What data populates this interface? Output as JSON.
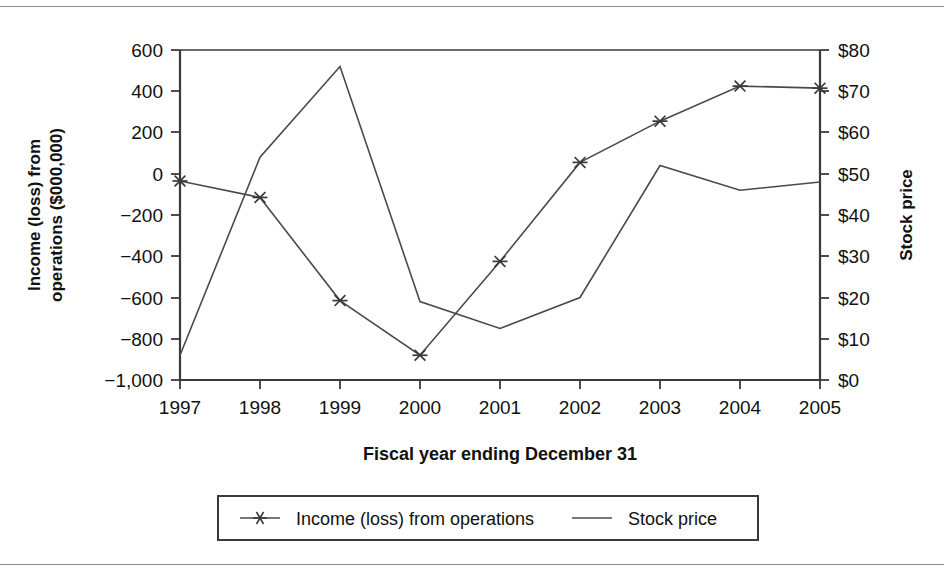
{
  "chart_data": {
    "type": "line",
    "title": "",
    "subtitle": "",
    "xlabel": "Fiscal year ending December 31",
    "categories": [
      "1997",
      "1998",
      "1999",
      "2000",
      "2001",
      "2002",
      "2003",
      "2004",
      "2005"
    ],
    "grid": false,
    "legend_position": "bottom",
    "axes": {
      "left": {
        "label": "Income (loss) from operations ($000,000)",
        "ticks": [
          "600",
          "400",
          "200",
          "0",
          "−200",
          "−400",
          "−600",
          "−800",
          "−1,000"
        ],
        "tick_values": [
          600,
          400,
          200,
          0,
          -200,
          -400,
          -600,
          -800,
          -1000
        ],
        "ylim": [
          -1000,
          600
        ]
      },
      "right": {
        "label": "Stock price",
        "ticks": [
          "$80",
          "$70",
          "$60",
          "$50",
          "$40",
          "$30",
          "$20",
          "$10",
          "$0"
        ],
        "tick_values": [
          80,
          70,
          60,
          50,
          40,
          30,
          20,
          10,
          0
        ],
        "ylim": [
          0,
          80
        ]
      }
    },
    "series": [
      {
        "name": "Income (loss) from operations",
        "axis": "left",
        "marker": "asterisk",
        "color": "#4a4a4a",
        "values": [
          -35,
          -115,
          -615,
          -880,
          -425,
          55,
          255,
          425,
          415
        ]
      },
      {
        "name": "Stock price",
        "axis": "right",
        "marker": "none",
        "color": "#4a4a4a",
        "values": [
          6,
          54,
          76,
          19,
          12.5,
          20,
          52,
          46,
          48
        ]
      }
    ]
  },
  "legend": {
    "items": [
      {
        "label": "Income (loss) from operations",
        "marker": "asterisk"
      },
      {
        "label": "Stock price",
        "marker": "line"
      }
    ]
  }
}
